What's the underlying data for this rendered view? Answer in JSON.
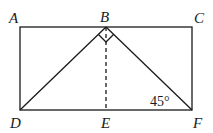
{
  "diagram": {
    "type": "geometry",
    "points": {
      "A": {
        "label": "A",
        "x": 20,
        "y": 27
      },
      "B": {
        "label": "B",
        "x": 106,
        "y": 27
      },
      "C": {
        "label": "C",
        "x": 192,
        "y": 27
      },
      "D": {
        "label": "D",
        "x": 20,
        "y": 110
      },
      "E": {
        "label": "E",
        "x": 106,
        "y": 110
      },
      "F": {
        "label": "F",
        "x": 192,
        "y": 110
      }
    },
    "segments": [
      {
        "from": "A",
        "to": "C",
        "style": "solid"
      },
      {
        "from": "C",
        "to": "F",
        "style": "solid"
      },
      {
        "from": "F",
        "to": "D",
        "style": "solid"
      },
      {
        "from": "D",
        "to": "A",
        "style": "solid"
      },
      {
        "from": "D",
        "to": "B",
        "style": "solid"
      },
      {
        "from": "B",
        "to": "F",
        "style": "solid"
      },
      {
        "from": "B",
        "to": "E",
        "style": "dashed"
      }
    ],
    "right_angle_at": "B",
    "angle_annotation": {
      "vertex": "F",
      "text": "45°"
    },
    "colors": {
      "stroke": "#1a1a1a",
      "background": "#ffffff"
    }
  }
}
